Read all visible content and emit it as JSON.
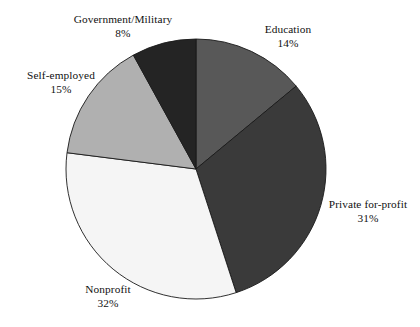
{
  "chart_data": {
    "type": "pie",
    "title": "",
    "subtitle": "",
    "xlabel": "",
    "ylabel": "",
    "legend_position": "none",
    "grid": false,
    "labels_outside": true,
    "start_angle_deg": 0,
    "direction": "clockwise",
    "categories": [
      "Education",
      "Private for-profit",
      "Nonprofit",
      "Self-employed",
      "Government/Military"
    ],
    "values": [
      14,
      31,
      32,
      15,
      8
    ],
    "value_unit": "%",
    "slices": [
      {
        "name": "Education",
        "value": 14,
        "label": "Education",
        "value_label": "14%",
        "color": "#585858",
        "start_deg": 0,
        "end_deg": 50.4
      },
      {
        "name": "Private for-profit",
        "value": 31,
        "label": "Private for-profit",
        "value_label": "31%",
        "color": "#3a3a3a",
        "start_deg": 50.4,
        "end_deg": 162.0
      },
      {
        "name": "Nonprofit",
        "value": 32,
        "label": "Nonprofit",
        "value_label": "32%",
        "color": "#f5f5f5",
        "start_deg": 162.0,
        "end_deg": 277.2
      },
      {
        "name": "Self-employed",
        "value": 15,
        "label": "Self-employed",
        "value_label": "15%",
        "color": "#b0b0b0",
        "start_deg": 277.2,
        "end_deg": 331.2
      },
      {
        "name": "Government/Military",
        "value": 8,
        "label": "Government/Military",
        "value_label": "8%",
        "color": "#242424",
        "start_deg": 331.2,
        "end_deg": 360.0
      }
    ],
    "total": 100,
    "outline_color": "#1a1a1a",
    "background_color": "#ffffff",
    "geometry": {
      "center_x": 196,
      "center_y": 169,
      "radius": 130
    }
  }
}
